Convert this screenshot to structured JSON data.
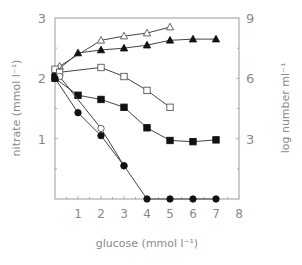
{
  "chart_data": {
    "type": "line",
    "title": "",
    "xlabel": "glucose  (mmol  l⁻¹)",
    "ylabel": "nitrate  (mmol  l⁻¹)",
    "ylabel_right": "log  number  ml⁻¹",
    "xlim": [
      0,
      8
    ],
    "ylim": [
      0,
      3
    ],
    "ylim_right": [
      0,
      9
    ],
    "x_ticks": [
      "1",
      "2",
      "3",
      "4",
      "5",
      "6",
      "7",
      "8"
    ],
    "y_ticks": [
      "1",
      "2",
      "3"
    ],
    "y_ticks_right": [
      "3",
      "6",
      "9"
    ],
    "grid": false,
    "legend": null,
    "series": [
      {
        "name": "open triangles",
        "marker": "triangle-open",
        "axis": "right",
        "x": [
          0.2,
          2,
          3,
          4,
          5
        ],
        "y": [
          2.2,
          2.63,
          2.7,
          2.75,
          2.85
        ]
      },
      {
        "name": "filled triangles",
        "marker": "triangle-filled",
        "axis": "right",
        "x": [
          0,
          1,
          2,
          3,
          4,
          5,
          6,
          7
        ],
        "y": [
          2.1,
          2.42,
          2.47,
          2.5,
          2.55,
          2.63,
          2.65,
          2.65
        ]
      },
      {
        "name": "open squares",
        "marker": "square-open",
        "axis": "right",
        "x": [
          0,
          0.2,
          2,
          3,
          4,
          5
        ],
        "y": [
          2.15,
          2.1,
          2.18,
          2.03,
          1.8,
          1.52
        ]
      },
      {
        "name": "filled squares",
        "marker": "square-filled",
        "axis": "left",
        "x": [
          0,
          1,
          2,
          3,
          4,
          5,
          6,
          7
        ],
        "y": [
          2.0,
          1.72,
          1.65,
          1.52,
          1.18,
          0.97,
          0.95,
          0.98
        ]
      },
      {
        "name": "open circles",
        "marker": "circle-open",
        "axis": "left",
        "x": [
          0.2,
          2,
          3
        ],
        "y": [
          2.03,
          1.17,
          0.55
        ]
      },
      {
        "name": "filled circles",
        "marker": "circle-filled",
        "axis": "left",
        "x": [
          0,
          1,
          2,
          3,
          4,
          5,
          6,
          7
        ],
        "y": [
          2.0,
          1.43,
          1.05,
          0.55,
          0.0,
          0.0,
          0.0,
          0.0
        ]
      }
    ]
  },
  "colors": {
    "axis": "#9a9a9a",
    "series_line": "#444444",
    "marker_fill": "#111111",
    "open_marker_fill": "#ffffff",
    "text": "#8a8a8a"
  }
}
